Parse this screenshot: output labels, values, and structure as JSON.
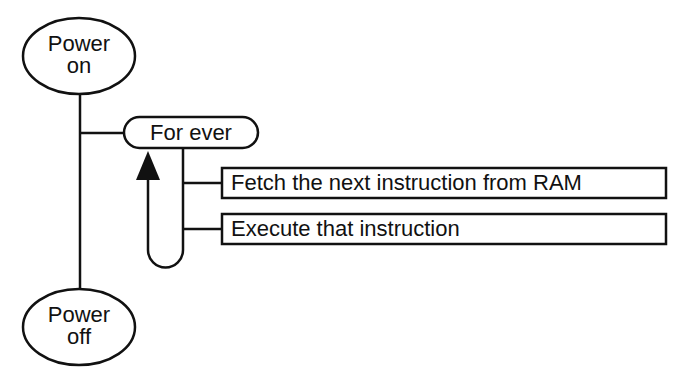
{
  "diagram": {
    "type": "structure-chart",
    "nodes": {
      "power_on": {
        "line1": "Power",
        "line2": "on",
        "shape": "ellipse"
      },
      "loop": {
        "label": "For ever",
        "shape": "pill"
      },
      "fetch": {
        "label": "Fetch the next instruction from RAM",
        "shape": "rectangle"
      },
      "execute": {
        "label": "Execute that instruction",
        "shape": "rectangle"
      },
      "power_off": {
        "line1": "Power",
        "line2": "off",
        "shape": "ellipse"
      }
    },
    "edges": [
      {
        "from": "power_on",
        "to": "power_off",
        "type": "sequence-line"
      },
      {
        "from": "power_on",
        "to": "loop",
        "type": "branch"
      },
      {
        "from": "loop",
        "to": "fetch",
        "type": "branch"
      },
      {
        "from": "loop",
        "to": "execute",
        "type": "branch"
      },
      {
        "from": "execute",
        "to": "loop",
        "type": "loop-back-arrow"
      }
    ],
    "colors": {
      "stroke": "#111111",
      "background": "#ffffff"
    }
  }
}
